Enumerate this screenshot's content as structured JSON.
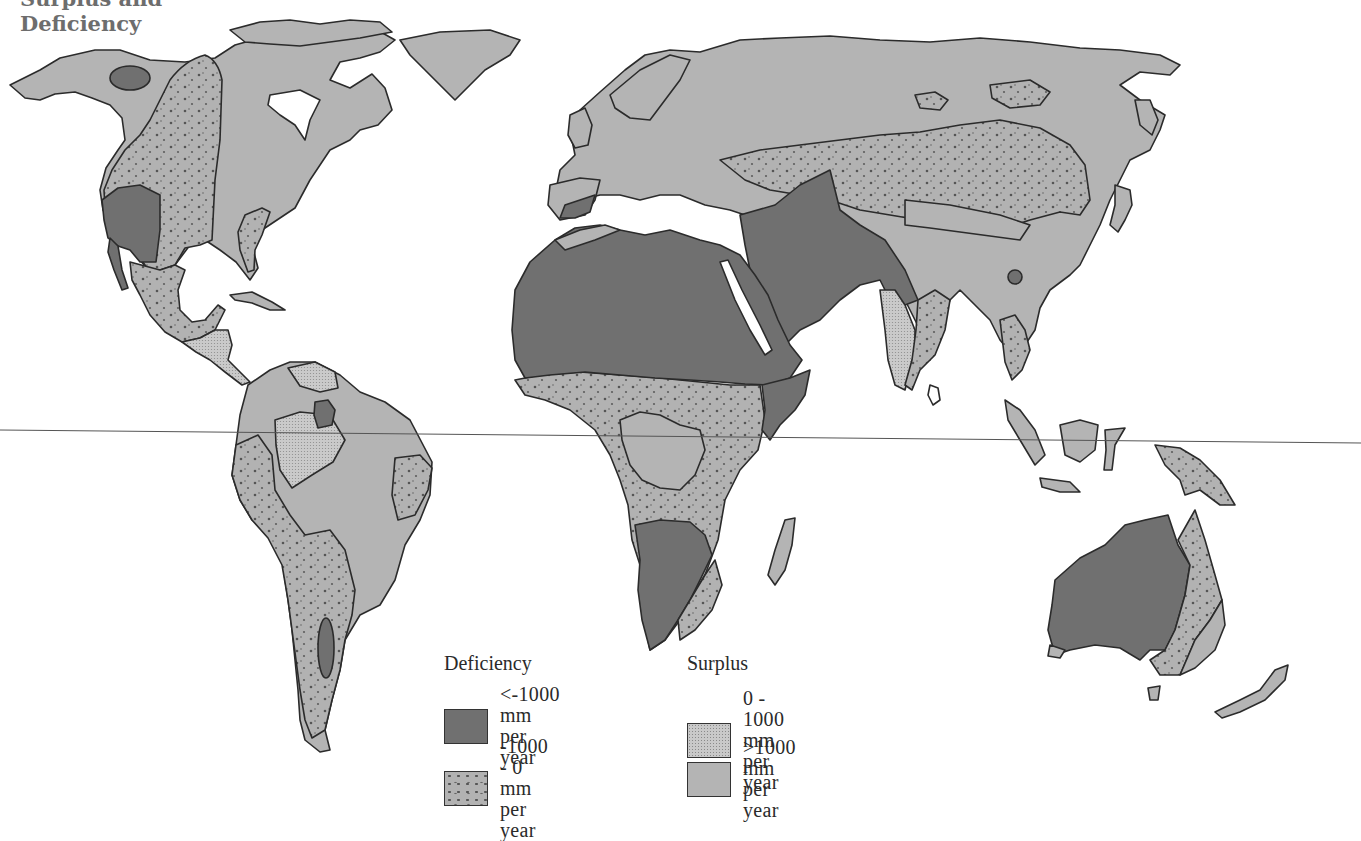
{
  "title": {
    "line1": "Surplus and",
    "line2": "Deficiency"
  },
  "legend": {
    "deficiency": {
      "heading": "Deficiency",
      "items": [
        {
          "label_line1": "<-1000 mm",
          "label_line2": "per year",
          "pattern": "solid-dark",
          "color": "#707070"
        },
        {
          "label_line1": "-1000 - 0 mm",
          "label_line2": "per year",
          "pattern": "dotted",
          "color": "#b2b2b2"
        }
      ]
    },
    "surplus": {
      "heading": "Surplus",
      "items": [
        {
          "label": "0 - 1000 mm per year",
          "pattern": "fine-stipple",
          "color": "#c9c9c9"
        },
        {
          "label": ">1000 mm per year",
          "pattern": "solid-light",
          "color": "#b4b4b4"
        }
      ]
    }
  },
  "map": {
    "features": [
      "equator-line"
    ],
    "colors": {
      "deficit_high": "#707070",
      "deficit_low": "#b2b2b2",
      "surplus_low": "#c9c9c9",
      "surplus_high": "#b4b4b4",
      "outline": "#2b2b2b",
      "background": "#ffffff"
    }
  }
}
